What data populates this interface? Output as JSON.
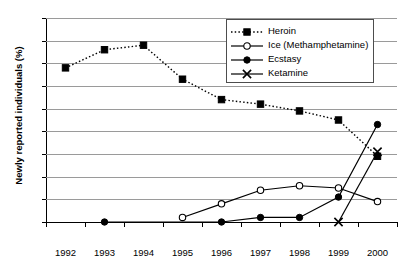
{
  "chart_data": {
    "type": "line",
    "title": "",
    "xlabel": "",
    "ylabel": "Newly reported individuals (%)",
    "categories": [
      "1992",
      "1993",
      "1994",
      "1995",
      "1996",
      "1997",
      "1998",
      "1999",
      "2000"
    ],
    "yticks": [
      0,
      10,
      20,
      30,
      40,
      50,
      60,
      70,
      80,
      90
    ],
    "ylim": [
      0,
      90
    ],
    "grid": "horizontal",
    "legend_position": "top-right",
    "series": [
      {
        "name": "Heroin",
        "marker": "filled-square",
        "line": "dotted",
        "color": "#000000",
        "values": [
          68,
          76,
          78,
          63,
          54,
          52,
          49,
          45,
          29
        ]
      },
      {
        "name": "Ice (Methamphetamine)",
        "marker": "open-circle",
        "line": "solid",
        "color": "#000000",
        "values": [
          null,
          null,
          null,
          2,
          8,
          14,
          16,
          15,
          9
        ]
      },
      {
        "name": "Ecstasy",
        "marker": "filled-circle",
        "line": "solid",
        "color": "#000000",
        "values": [
          null,
          0,
          null,
          null,
          0,
          2,
          2,
          11,
          43
        ]
      },
      {
        "name": "Ketamine",
        "marker": "cross-x",
        "line": "solid",
        "color": "#000000",
        "values": [
          null,
          null,
          null,
          null,
          null,
          null,
          null,
          0,
          31
        ]
      }
    ]
  }
}
